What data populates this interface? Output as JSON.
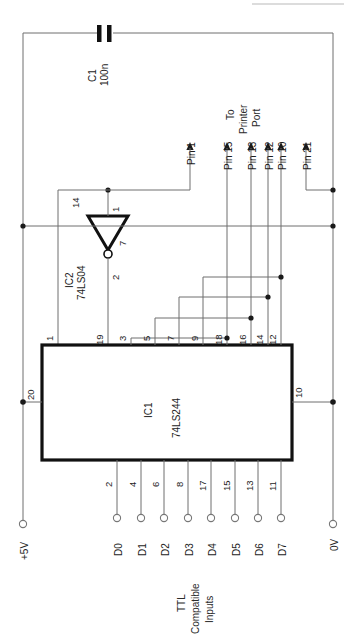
{
  "diagram": {
    "orientation": "rotated-90",
    "colors": {
      "wire": "#6e6e6e",
      "outline": "#111111",
      "junction": "#1a1a1a",
      "background": "#ffffff"
    }
  },
  "components": {
    "ic1": {
      "ref": "IC1",
      "type": "74LS244",
      "top_pins": [
        "1",
        "19",
        "3",
        "5",
        "7",
        "9",
        "18",
        "16",
        "14",
        "12"
      ],
      "bottom_pins": [
        "2",
        "4",
        "6",
        "8",
        "17",
        "15",
        "13",
        "11"
      ],
      "power_pin": "20",
      "ground_pin": "10"
    },
    "ic2": {
      "ref": "IC2",
      "type": "74LS04",
      "pin_in": "1",
      "pin_out": "2",
      "pin_vcc": "14",
      "pin_gnd": "7"
    },
    "c1": {
      "ref": "C1",
      "value": "100n"
    }
  },
  "rails": {
    "positive_label": "+5V",
    "ground_label": "0V"
  },
  "printer_port": {
    "caption_line1": "To",
    "caption_line2": "Printer",
    "caption_line3": "Port",
    "pins": [
      {
        "label": "Pin 1"
      },
      {
        "label": "Pin 15"
      },
      {
        "label": "Pin 13"
      },
      {
        "label": "Pin 12"
      },
      {
        "label": "Pin 10"
      },
      {
        "label": "Pin 21"
      }
    ]
  },
  "data_inputs": {
    "caption_line1": "TTL",
    "caption_line2": "Compatible",
    "caption_line3": "Inputs",
    "terminals": [
      {
        "label": "D0",
        "pin": "2"
      },
      {
        "label": "D1",
        "pin": "4"
      },
      {
        "label": "D2",
        "pin": "6"
      },
      {
        "label": "D3",
        "pin": "8"
      },
      {
        "label": "D4",
        "pin": "17"
      },
      {
        "label": "D5",
        "pin": "15"
      },
      {
        "label": "D6",
        "pin": "13"
      },
      {
        "label": "D7",
        "pin": "11"
      }
    ]
  }
}
